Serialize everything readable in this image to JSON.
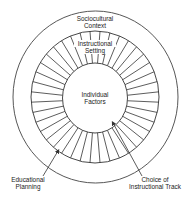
{
  "diagram": {
    "type": "concentric-circles",
    "outer_circle": {
      "label_line1": "Sociocultural",
      "label_line2": "Context"
    },
    "spoked_ring": {
      "label_line1": "Instructional",
      "label_line2": "Setting",
      "spoke_count": 40
    },
    "inner_circle": {
      "label_line1": "Individual",
      "label_line2": "Factors"
    },
    "callouts": [
      {
        "label_line1": "Educational",
        "label_line2": "Planning"
      },
      {
        "label_line1": "Choice of",
        "label_line2": "Instructional Track"
      }
    ],
    "colors": {
      "stroke": "#333333",
      "background": "#ffffff",
      "text": "#222222"
    }
  }
}
